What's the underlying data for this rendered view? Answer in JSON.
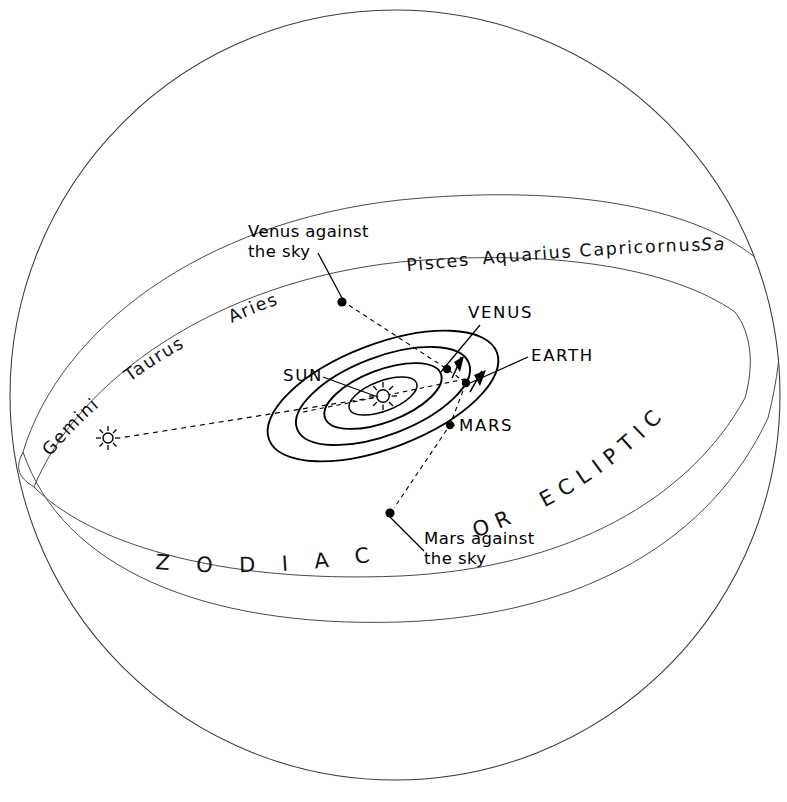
{
  "figure": {
    "background_color": "#ffffff",
    "line_color": "#000000",
    "sphere": {
      "center_x": 395,
      "center_y": 395,
      "radius": 385
    }
  },
  "zodiac_band": {
    "band_name_part1": "Z O D I A C",
    "band_name_part2_or": "OR",
    "band_name_part3": "ECLIPTIC",
    "constellations": [
      {
        "id": "gemini",
        "label": "Gemini"
      },
      {
        "id": "taurus",
        "label": "Taurus"
      },
      {
        "id": "aries",
        "label": "Aries"
      },
      {
        "id": "pisces",
        "label": "Pisces"
      },
      {
        "id": "aquarius",
        "label": "Aquarius"
      },
      {
        "id": "capricornus",
        "label": "Capricornus"
      },
      {
        "id": "sagittarius",
        "label": "Sa"
      }
    ]
  },
  "solar_system": {
    "center_body": {
      "label": "SUN",
      "x": 383,
      "y": 396
    },
    "orbit_count": 4,
    "planets": [
      {
        "label": "VENUS",
        "dot_x": 447,
        "dot_y": 369
      },
      {
        "label": "EARTH",
        "dot_x": 466,
        "dot_y": 383
      },
      {
        "label": "MARS",
        "dot_x": 450,
        "dot_y": 425
      }
    ]
  },
  "projections": [
    {
      "id": "venus-projection",
      "line1": "Venus against",
      "line2": "the sky",
      "dot_x": 342,
      "dot_y": 302
    },
    {
      "id": "mars-projection",
      "line1": "Mars against",
      "line2": "the sky",
      "dot_x": 390,
      "dot_y": 513
    }
  ],
  "sun_marker_on_band": {
    "id": "sun-on-zodiac",
    "x": 108,
    "y": 438
  }
}
